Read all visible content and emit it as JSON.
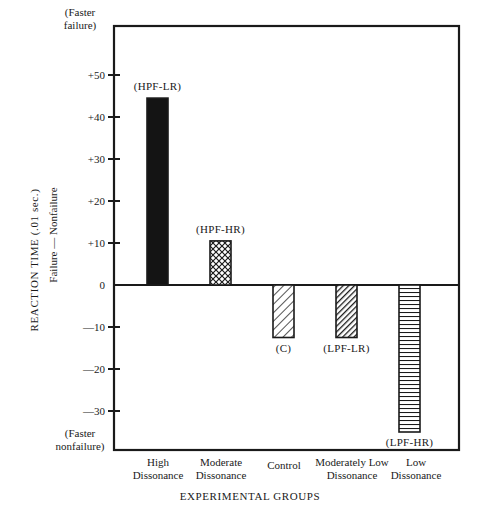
{
  "chart_data": {
    "type": "bar",
    "title": "",
    "xlabel": "EXPERIMENTAL GROUPS",
    "ylabel": "REACTION TIME (.01 sec.)",
    "ylabel_sub": "Failure — Nonfailure",
    "ylim": [
      -37,
      59
    ],
    "grid": false,
    "legend": null,
    "y_ticks": [
      {
        "value": 50,
        "label": "+50"
      },
      {
        "value": 40,
        "label": "+40"
      },
      {
        "value": 30,
        "label": "+30"
      },
      {
        "value": 20,
        "label": "+20"
      },
      {
        "value": 10,
        "label": "+10"
      },
      {
        "value": 0,
        "label": "0"
      },
      {
        "value": -10,
        "label": "—10"
      },
      {
        "value": -20,
        "label": "—20"
      },
      {
        "value": -30,
        "label": "—30"
      }
    ],
    "y_top_annotation": [
      "(Faster",
      "failure)"
    ],
    "y_bottom_annotation": [
      "(Faster",
      "nonfailure)"
    ],
    "categories": [
      [
        "High",
        "Dissonance"
      ],
      [
        "Moderate",
        "Dissonance"
      ],
      [
        "Control"
      ],
      [
        "Moderately Low",
        "Dissonance"
      ],
      [
        "Low",
        "Dissonance"
      ]
    ],
    "bar_labels": [
      "(HPF-LR)",
      "(HPF-HR)",
      "(C)",
      "(LPF-LR)",
      "(LPF-HR)"
    ],
    "patterns": [
      "solid",
      "crosshatch",
      "diagonal-sparse",
      "diagonal-dense",
      "horizontal"
    ],
    "values": [
      44.5,
      10.5,
      -12.5,
      -12.5,
      -35
    ]
  }
}
